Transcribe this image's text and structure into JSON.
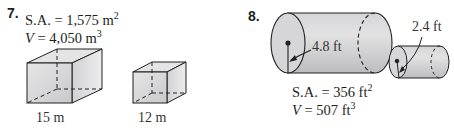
{
  "problems": [
    {
      "number": "7.",
      "surface_area": {
        "label": "S.A. = ",
        "value": "1,575 m",
        "exp": "2"
      },
      "volume": {
        "var": "V",
        "eq": " = 4,050 m",
        "exp": "3"
      },
      "figures": [
        {
          "shape": "rectangular-prism-cube",
          "label": "15 m"
        },
        {
          "shape": "rectangular-prism-cube",
          "label": "12 m"
        }
      ]
    },
    {
      "number": "8.",
      "surface_area": {
        "label": "S.A. = ",
        "value": "356 ft",
        "exp": "2"
      },
      "volume": {
        "var": "V",
        "eq": " = 507 ft",
        "exp": "3"
      },
      "figures": [
        {
          "shape": "cylinder",
          "label": "4.8 ft"
        },
        {
          "shape": "cylinder",
          "label": "2.4 ft"
        }
      ]
    }
  ],
  "colors": {
    "face_fill": "#d9d9da",
    "side_fill": "#c6c6c8",
    "stroke": "#231f20"
  }
}
